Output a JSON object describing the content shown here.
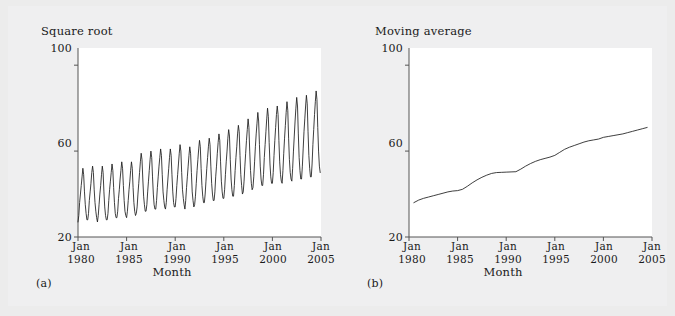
{
  "figure": {
    "background_color": "#ececec",
    "panel_background_color": "#ffffff",
    "line_color": "#1c1c1c",
    "axis_color": "#555555",
    "text_color": "#1a1a1a"
  },
  "panels": [
    {
      "id": "a",
      "sub_label": "(a)",
      "ylab_title": "Square root",
      "xlab_title": "Month",
      "ytick_labels": [
        "100",
        "60",
        "20"
      ],
      "xtick_labels": [
        {
          "line1": "Jan",
          "line2": "1980"
        },
        {
          "line1": "Jan",
          "line2": "1985"
        },
        {
          "line1": "Jan",
          "line2": "1990"
        },
        {
          "line1": "Jan",
          "line2": "1995"
        },
        {
          "line1": "Jan",
          "line2": "2000"
        },
        {
          "line1": "Jan",
          "line2": "2005"
        }
      ]
    },
    {
      "id": "b",
      "sub_label": "(b)",
      "ylab_title": "Moving average",
      "xlab_title": "Month",
      "ytick_labels": [
        "100",
        "60",
        "20"
      ],
      "xtick_labels": [
        {
          "line1": "Jan",
          "line2": "1980"
        },
        {
          "line1": "Jan",
          "line2": "1985"
        },
        {
          "line1": "Jan",
          "line2": "1990"
        },
        {
          "line1": "Jan",
          "line2": "1995"
        },
        {
          "line1": "Jan",
          "line2": "2000"
        },
        {
          "line1": "Jan",
          "line2": "2005"
        }
      ]
    }
  ],
  "chart_data": [
    {
      "type": "line",
      "panel": "a",
      "title": "",
      "ylabel": "Square root",
      "xlabel": "Month",
      "ylim": [
        20,
        108
      ],
      "yticks": [
        20,
        60,
        100
      ],
      "xlim": [
        1980.0,
        2005.0
      ],
      "xticks": [
        1980,
        1985,
        1990,
        1995,
        2000,
        2005
      ],
      "xtick_labels": [
        "Jan 1980",
        "Jan 1985",
        "Jan 1990",
        "Jan 1995",
        "Jan 2000",
        "Jan 2005"
      ],
      "grid": false,
      "legend": null,
      "series": [
        {
          "name": "Square root of monthly series",
          "description": "Strongly seasonal monthly series with a rising trend and slowly growing seasonal amplitude",
          "trend_start": 37.0,
          "trend_end": 72.0,
          "seasonal_amplitude_start": 9.0,
          "seasonal_amplitude_end": 12.0,
          "period_months": 12,
          "x": [
            1980.0,
            1980.0833,
            1980.1667,
            1980.25,
            1980.3333,
            1980.4167,
            1980.5,
            1980.5833,
            1980.6667,
            1980.75,
            1980.8333,
            1980.9167,
            1981.0,
            1981.0833,
            1981.1667,
            1981.25,
            1981.3333,
            1981.4167,
            1981.5,
            1981.5833,
            1981.6667,
            1981.75,
            1981.8333,
            1981.9167,
            1982.0,
            1982.0833,
            1982.1667,
            1982.25,
            1982.3333,
            1982.4167,
            1982.5,
            1982.5833,
            1982.6667,
            1982.75,
            1982.8333,
            1982.9167,
            1983.0,
            1983.0833,
            1983.1667,
            1983.25,
            1983.3333,
            1983.4167,
            1983.5,
            1983.5833,
            1983.6667,
            1983.75,
            1983.8333,
            1983.9167,
            1984.0,
            1984.0833,
            1984.1667,
            1984.25,
            1984.3333,
            1984.4167,
            1984.5,
            1984.5833,
            1984.6667,
            1984.75,
            1984.8333,
            1984.9167,
            1985.0,
            1985.0833,
            1985.1667,
            1985.25,
            1985.3333,
            1985.4167,
            1985.5,
            1985.5833,
            1985.6667,
            1985.75,
            1985.8333,
            1985.9167,
            1986.0,
            1986.0833,
            1986.1667,
            1986.25,
            1986.3333,
            1986.4167,
            1986.5,
            1986.5833,
            1986.6667,
            1986.75,
            1986.8333,
            1986.9167,
            1987.0,
            1987.0833,
            1987.1667,
            1987.25,
            1987.3333,
            1987.4167,
            1987.5,
            1987.5833,
            1987.6667,
            1987.75,
            1987.8333,
            1987.9167,
            1988.0,
            1988.0833,
            1988.1667,
            1988.25,
            1988.3333,
            1988.4167,
            1988.5,
            1988.5833,
            1988.6667,
            1988.75,
            1988.8333,
            1988.9167,
            1989.0,
            1989.0833,
            1989.1667,
            1989.25,
            1989.3333,
            1989.4167,
            1989.5,
            1989.5833,
            1989.6667,
            1989.75,
            1989.8333,
            1989.9167,
            1990.0,
            1990.0833,
            1990.1667,
            1990.25,
            1990.3333,
            1990.4167,
            1990.5,
            1990.5833,
            1990.6667,
            1990.75,
            1990.8333,
            1990.9167,
            1991.0,
            1991.0833,
            1991.1667,
            1991.25,
            1991.3333,
            1991.4167,
            1991.5,
            1991.5833,
            1991.6667,
            1991.75,
            1991.8333,
            1991.9167,
            1992.0,
            1992.0833,
            1992.1667,
            1992.25,
            1992.3333,
            1992.4167,
            1992.5,
            1992.5833,
            1992.6667,
            1992.75,
            1992.8333,
            1992.9167,
            1993.0,
            1993.0833,
            1993.1667,
            1993.25,
            1993.3333,
            1993.4167,
            1993.5,
            1993.5833,
            1993.6667,
            1993.75,
            1993.8333,
            1993.9167,
            1994.0,
            1994.0833,
            1994.1667,
            1994.25,
            1994.3333,
            1994.4167,
            1994.5,
            1994.5833,
            1994.6667,
            1994.75,
            1994.8333,
            1994.9167,
            1995.0,
            1995.0833,
            1995.1667,
            1995.25,
            1995.3333,
            1995.4167,
            1995.5,
            1995.5833,
            1995.6667,
            1995.75,
            1995.8333,
            1995.9167,
            1996.0,
            1996.0833,
            1996.1667,
            1996.25,
            1996.3333,
            1996.4167,
            1996.5,
            1996.5833,
            1996.6667,
            1996.75,
            1996.8333,
            1996.9167,
            1997.0,
            1997.0833,
            1997.1667,
            1997.25,
            1997.3333,
            1997.4167,
            1997.5,
            1997.5833,
            1997.6667,
            1997.75,
            1997.8333,
            1997.9167,
            1998.0,
            1998.0833,
            1998.1667,
            1998.25,
            1998.3333,
            1998.4167,
            1998.5,
            1998.5833,
            1998.6667,
            1998.75,
            1998.8333,
            1998.9167,
            1999.0,
            1999.0833,
            1999.1667,
            1999.25,
            1999.3333,
            1999.4167,
            1999.5,
            1999.5833,
            1999.6667,
            1999.75,
            1999.8333,
            1999.9167,
            2000.0,
            2000.0833,
            2000.1667,
            2000.25,
            2000.3333,
            2000.4167,
            2000.5,
            2000.5833,
            2000.6667,
            2000.75,
            2000.8333,
            2000.9167,
            2001.0,
            2001.0833,
            2001.1667,
            2001.25,
            2001.3333,
            2001.4167,
            2001.5,
            2001.5833,
            2001.6667,
            2001.75,
            2001.8333,
            2001.9167,
            2002.0,
            2002.0833,
            2002.1667,
            2002.25,
            2002.3333,
            2002.4167,
            2002.5,
            2002.5833,
            2002.6667,
            2002.75,
            2002.8333,
            2002.9167,
            2003.0,
            2003.0833,
            2003.1667,
            2003.25,
            2003.3333,
            2003.4167,
            2003.5,
            2003.5833,
            2003.6667,
            2003.75,
            2003.8333,
            2003.9167,
            2004.0,
            2004.0833,
            2004.1667,
            2004.25,
            2004.3333,
            2004.4167,
            2004.5,
            2004.5833,
            2004.6667,
            2004.75,
            2004.8333,
            2004.9167
          ],
          "values": [
            27,
            30,
            36,
            40,
            44,
            48,
            52,
            49,
            41,
            35,
            31,
            28,
            28,
            31,
            37,
            41,
            45,
            50,
            53,
            50,
            42,
            36,
            32,
            29,
            27,
            30,
            35,
            40,
            44,
            49,
            53,
            50,
            41,
            34,
            30,
            28,
            28,
            31,
            37,
            42,
            46,
            50,
            54,
            51,
            43,
            36,
            31,
            29,
            29,
            32,
            38,
            42,
            47,
            51,
            55,
            52,
            44,
            37,
            32,
            30,
            29,
            32,
            37,
            42,
            46,
            51,
            55,
            52,
            43,
            36,
            32,
            30,
            31,
            34,
            40,
            45,
            50,
            55,
            59,
            56,
            47,
            39,
            35,
            32,
            32,
            35,
            41,
            46,
            51,
            56,
            60,
            57,
            48,
            40,
            35,
            33,
            33,
            37,
            43,
            48,
            53,
            57,
            61,
            58,
            49,
            41,
            37,
            34,
            33,
            36,
            42,
            47,
            52,
            57,
            61,
            58,
            49,
            41,
            36,
            34,
            34,
            38,
            44,
            49,
            54,
            59,
            63,
            60,
            50,
            42,
            38,
            35,
            33,
            37,
            43,
            48,
            53,
            58,
            62,
            59,
            50,
            41,
            37,
            34,
            35,
            39,
            45,
            51,
            56,
            61,
            65,
            62,
            52,
            44,
            39,
            36,
            36,
            40,
            46,
            52,
            57,
            62,
            66,
            63,
            53,
            45,
            40,
            37,
            37,
            41,
            48,
            53,
            59,
            64,
            68,
            65,
            55,
            46,
            41,
            38,
            38,
            42,
            49,
            55,
            60,
            66,
            70,
            67,
            56,
            47,
            42,
            39,
            39,
            44,
            51,
            57,
            62,
            68,
            72,
            69,
            58,
            49,
            44,
            40,
            41,
            46,
            53,
            59,
            65,
            70,
            75,
            71,
            60,
            51,
            45,
            42,
            43,
            48,
            55,
            62,
            68,
            73,
            78,
            74,
            63,
            53,
            47,
            44,
            44,
            49,
            57,
            63,
            69,
            75,
            80,
            76,
            64,
            54,
            48,
            45,
            45,
            50,
            58,
            65,
            71,
            77,
            81,
            77,
            65,
            55,
            49,
            46,
            45,
            51,
            59,
            66,
            72,
            78,
            83,
            79,
            66,
            56,
            50,
            47,
            46,
            52,
            60,
            67,
            74,
            80,
            85,
            81,
            68,
            57,
            51,
            47,
            47,
            53,
            61,
            69,
            75,
            81,
            86,
            82,
            69,
            58,
            52,
            48,
            48,
            54,
            63,
            70,
            77,
            83,
            88,
            84,
            71,
            60,
            53,
            50
          ]
        }
      ]
    },
    {
      "type": "line",
      "panel": "b",
      "title": "",
      "ylabel": "Moving average",
      "xlabel": "Month",
      "ylim": [
        20,
        108
      ],
      "yticks": [
        20,
        60,
        100
      ],
      "xlim": [
        1980.0,
        2005.0
      ],
      "xticks": [
        1980,
        1985,
        1990,
        1995,
        2000,
        2005
      ],
      "xtick_labels": [
        "Jan 1980",
        "Jan 1985",
        "Jan 1990",
        "Jan 1995",
        "Jan 2000",
        "Jan 2005"
      ],
      "grid": false,
      "legend": null,
      "series": [
        {
          "name": "Centred 12-month moving average",
          "description": "Smooth monotone increasing trend with small plateaus around 1985-86 and 1989-91",
          "start_value": 36.0,
          "end_value": 71.0,
          "x": [
            1980.5,
            1981.0,
            1981.5,
            1982.0,
            1982.5,
            1983.0,
            1983.5,
            1984.0,
            1984.5,
            1985.0,
            1985.5,
            1986.0,
            1986.5,
            1987.0,
            1987.5,
            1988.0,
            1988.5,
            1989.0,
            1989.5,
            1990.0,
            1990.5,
            1991.0,
            1991.5,
            1992.0,
            1992.5,
            1993.0,
            1993.5,
            1994.0,
            1994.5,
            1995.0,
            1995.5,
            1996.0,
            1996.5,
            1997.0,
            1997.5,
            1998.0,
            1998.5,
            1999.0,
            1999.5,
            2000.0,
            2000.5,
            2001.0,
            2001.5,
            2002.0,
            2002.5,
            2003.0,
            2003.5,
            2004.0,
            2004.5
          ],
          "values": [
            36.0,
            37.2,
            38.0,
            38.6,
            39.2,
            39.8,
            40.4,
            41.0,
            41.4,
            41.6,
            42.2,
            43.6,
            45.2,
            46.6,
            47.8,
            48.8,
            49.6,
            50.0,
            50.1,
            50.2,
            50.3,
            50.4,
            51.6,
            53.0,
            54.2,
            55.2,
            56.0,
            56.6,
            57.2,
            58.0,
            59.4,
            60.8,
            61.8,
            62.6,
            63.4,
            64.2,
            64.8,
            65.2,
            65.6,
            66.4,
            66.8,
            67.2,
            67.6,
            68.0,
            68.6,
            69.2,
            69.8,
            70.4,
            71.0
          ]
        }
      ]
    }
  ]
}
